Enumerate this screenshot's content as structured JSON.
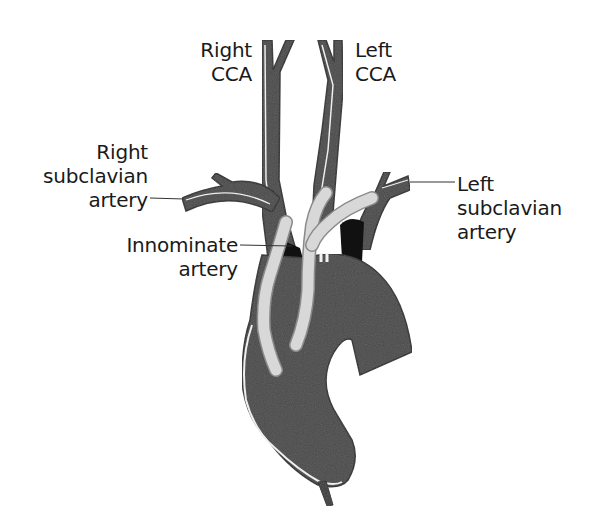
{
  "diagram": {
    "colors": {
      "vessel_fill": "#4a4a4a",
      "vessel_edge": "#2a2a2a",
      "vessel_highlight": "#f2f2f2",
      "graft_fill": "#d8d8d8",
      "graft_edge": "#8a8a8a",
      "shadow": "#111111",
      "leader_line": "#333333",
      "text": "#1a1a1a",
      "background": "#ffffff"
    },
    "labels": {
      "right_cca": {
        "line1": "Right",
        "line2": "CCA"
      },
      "left_cca": {
        "line1": "Left",
        "line2": "CCA"
      },
      "right_subclavian": {
        "line1": "Right",
        "line2": "subclavian",
        "line3": "artery"
      },
      "left_subclavian": {
        "line1": "Left",
        "line2": "subclavian",
        "line3": "artery"
      },
      "innominate": {
        "line1": "Innominate",
        "line2": "artery"
      }
    }
  }
}
